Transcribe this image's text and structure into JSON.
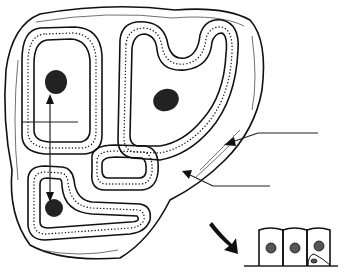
{
  "diagram": {
    "title": "",
    "colors": {
      "ink": "#111111",
      "background": "#ffffff"
    },
    "tubules": [
      {
        "id": "left-upper",
        "egg": true
      },
      {
        "id": "right-u-shaped",
        "egg": true
      },
      {
        "id": "small-round",
        "egg": false
      },
      {
        "id": "left-lower",
        "egg": true
      }
    ],
    "leader_lines": [
      {
        "id": "label-line-1",
        "text": ""
      },
      {
        "id": "label-line-2",
        "text": ""
      }
    ],
    "double_arrow": {
      "from": "left-upper",
      "to": "left-lower"
    },
    "inset": {
      "cells": 3,
      "description": "epithelial cells on basement membrane"
    }
  }
}
